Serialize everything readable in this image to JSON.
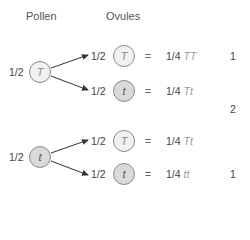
{
  "headers": {
    "pollen": "Pollen",
    "ovules": "Ovules"
  },
  "pollen": [
    {
      "prob": "1/2",
      "allele": "T",
      "type": "dominant"
    },
    {
      "prob": "1/2",
      "allele": "t",
      "type": "recessive"
    }
  ],
  "ovules": [
    {
      "prob": "1/2",
      "allele": "T",
      "eq": "=",
      "result_frac": "1/4",
      "genotype": "TT"
    },
    {
      "prob": "1/2",
      "allele": "t",
      "eq": "=",
      "result_frac": "1/4",
      "genotype": "Tt"
    },
    {
      "prob": "1/2",
      "allele": "T",
      "eq": "=",
      "result_frac": "1/4",
      "genotype": "Tt"
    },
    {
      "prob": "1/2",
      "allele": "t",
      "eq": "=",
      "result_frac": "1/4",
      "genotype": "tt"
    }
  ],
  "ratios": {
    "TT": "1",
    "Tt": "2",
    "tt": "1"
  },
  "colors": {
    "dominant_fill": "#f1f1f1",
    "recessive_fill": "#dadada",
    "stroke": "#8a8a8a",
    "arrow": "#333333"
  }
}
